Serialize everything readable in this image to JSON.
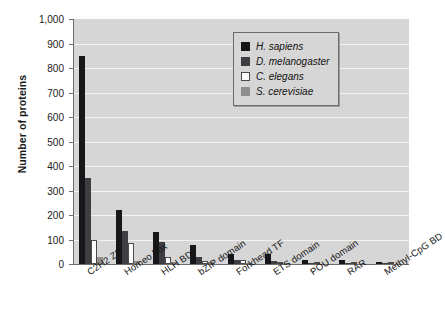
{
  "chart_data": {
    "type": "bar",
    "title": "",
    "subtitle": "",
    "xlabel": "",
    "ylabel": "Number of proteins",
    "ylim": [
      0,
      1000
    ],
    "ytick_labels": [
      "1,000",
      "900",
      "800",
      "700",
      "600",
      "500",
      "400",
      "300",
      "200",
      "100",
      "0"
    ],
    "ytick_values": [
      1000,
      900,
      800,
      700,
      600,
      500,
      400,
      300,
      200,
      100,
      0
    ],
    "grid": true,
    "legend_position": "top-right",
    "categories": [
      "C2H2 ZF",
      "Homeo box",
      "HLH BD",
      "bZIP domain",
      "Forkhead TF",
      "ETS domain",
      "POU domain",
      "RAR",
      "Methyl-CpG BD"
    ],
    "series": [
      {
        "name": "H. sapiens",
        "color": "#17171a",
        "values": [
          850,
          220,
          130,
          78,
          42,
          40,
          18,
          17,
          8
        ]
      },
      {
        "name": "D. melanogaster",
        "color": "#3d3d42",
        "values": [
          350,
          135,
          88,
          30,
          18,
          12,
          5,
          2,
          1
        ]
      },
      {
        "name": "C. elegans",
        "color": "#fdfdfd",
        "values": [
          100,
          85,
          30,
          12,
          17,
          10,
          3,
          1,
          0
        ]
      },
      {
        "name": "S. cerevisiae",
        "color": "#8e8e8e",
        "values": [
          30,
          12,
          8,
          10,
          4,
          2,
          0,
          0,
          0
        ]
      }
    ]
  },
  "legend": {
    "entries": [
      {
        "label": "H. sapiens"
      },
      {
        "label": "D. melanogaster"
      },
      {
        "label": "C. elegans"
      },
      {
        "label": "S. cerevisiae"
      }
    ]
  },
  "colors": {
    "plot_background": "#d6d6d6",
    "gridline": "#f2f2f2",
    "axis": "#6e6e6e",
    "page_background": "#ffffff"
  }
}
